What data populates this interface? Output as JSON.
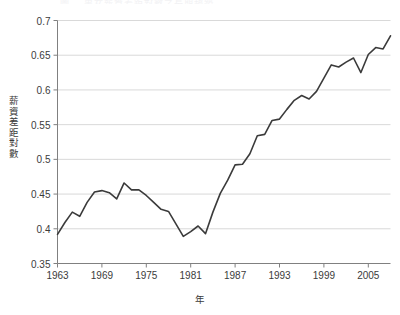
{
  "figure": {
    "ghost_title": "圖二  男女薪資差距對數之長期趨勢",
    "axis_color": "#808080",
    "grid_color": "#d9d9d9",
    "line_color": "#3b3b3b",
    "background": "#ffffff"
  },
  "chart_data": {
    "type": "line",
    "title": "",
    "xlabel": "年",
    "ylabel": "薪資差距對數",
    "ylim": [
      0.35,
      0.7
    ],
    "xlim": [
      1963,
      2008
    ],
    "grid": true,
    "legend": "none",
    "y_ticks": [
      "0.35",
      "0.4",
      "0.45",
      "0.5",
      "0.55",
      "0.6",
      "0.65",
      "0.7"
    ],
    "y_tick_values": [
      0.35,
      0.4,
      0.45,
      0.5,
      0.55,
      0.6,
      0.65,
      0.7
    ],
    "x_ticks": [
      "1963",
      "1969",
      "1975",
      "1981",
      "1987",
      "1993",
      "1999",
      "2005"
    ],
    "x_tick_values": [
      1963,
      1969,
      1975,
      1981,
      1987,
      1993,
      1999,
      2005
    ],
    "series": [
      {
        "name": "薪資差距對數",
        "x": [
          1963,
          1964,
          1965,
          1966,
          1967,
          1968,
          1969,
          1970,
          1971,
          1972,
          1973,
          1974,
          1975,
          1976,
          1977,
          1978,
          1979,
          1980,
          1981,
          1982,
          1983,
          1984,
          1985,
          1986,
          1987,
          1988,
          1989,
          1990,
          1991,
          1992,
          1993,
          1994,
          1995,
          1996,
          1997,
          1998,
          1999,
          2000,
          2001,
          2002,
          2003,
          2004,
          2005,
          2006,
          2007,
          2008
        ],
        "values": [
          0.392,
          0.409,
          0.424,
          0.418,
          0.438,
          0.453,
          0.455,
          0.452,
          0.443,
          0.466,
          0.456,
          0.456,
          0.448,
          0.438,
          0.428,
          0.425,
          0.407,
          0.389,
          0.396,
          0.404,
          0.393,
          0.424,
          0.451,
          0.47,
          0.492,
          0.493,
          0.508,
          0.534,
          0.536,
          0.556,
          0.558,
          0.572,
          0.585,
          0.592,
          0.587,
          0.598,
          0.617,
          0.636,
          0.633,
          0.64,
          0.646,
          0.625,
          0.651,
          0.661,
          0.659,
          0.678
        ]
      }
    ]
  }
}
